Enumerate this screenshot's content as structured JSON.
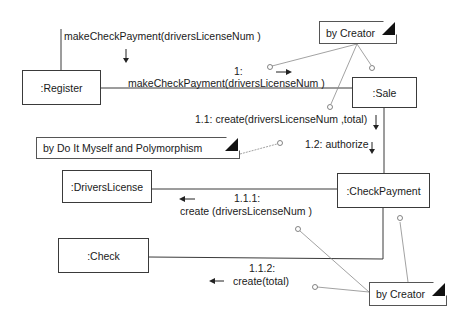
{
  "diagram": {
    "type": "UML collaboration diagram",
    "objects": [
      {
        "id": "register",
        "label": ":Register"
      },
      {
        "id": "sale",
        "label": ":Sale"
      },
      {
        "id": "drivers_license",
        "label": ":DriversLicense"
      },
      {
        "id": "check_payment",
        "label": ":CheckPayment"
      },
      {
        "id": "check",
        "label": ":Check"
      }
    ],
    "notes": [
      {
        "id": "note_creator_top",
        "label": "by Creator"
      },
      {
        "id": "note_do_it_myself",
        "label": "by Do It Myself and Polymorphism"
      },
      {
        "id": "note_creator_bottom",
        "label": "by Creator"
      }
    ],
    "messages": {
      "incoming": "makeCheckPayment(driversLicenseNum )",
      "m1_number": "1:",
      "m1_text": "makeCheckPayment(driversLicenseNum )",
      "m11": "1.1: create(driversLicenseNum ,total)",
      "m12": "1.2: authorize",
      "m111_number": "1.1.1:",
      "m111_text": "create (driversLicenseNum )",
      "m112_number": "1.1.2:",
      "m112_text": "create(total)"
    },
    "colors": {
      "line": "#3a3a3a",
      "note_link": "#8a8a8a",
      "fold": "#111111"
    }
  }
}
